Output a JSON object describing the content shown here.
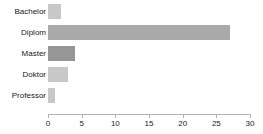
{
  "chart_data": {
    "type": "bar",
    "orientation": "horizontal",
    "title": "",
    "subtitle": "",
    "xlabel": "",
    "ylabel": "",
    "categories": [
      "Bachelor",
      "Diplom",
      "Master",
      "Doktor",
      "Professor"
    ],
    "values": [
      2,
      27,
      4,
      3,
      1
    ],
    "xlim": [
      0,
      30
    ],
    "xticks": [
      0,
      5,
      10,
      15,
      20,
      25,
      30
    ],
    "xtick_labels": [
      "0",
      "5",
      "10",
      "15",
      "20",
      "25",
      "30"
    ],
    "grid": false,
    "legend": null,
    "bar_colors": [
      "#c8c8c8",
      "#a9a9a9",
      "#969696",
      "#c8c8c8",
      "#c8c8c8"
    ],
    "axis_color": "#b3b3b3",
    "text_color": "#1a1a1a",
    "background": "#ffffff",
    "bars": [
      {
        "category": "Bachelor",
        "value": 2,
        "color": "#c8c8c8"
      },
      {
        "category": "Diplom",
        "value": 27,
        "color": "#a9a9a9"
      },
      {
        "category": "Master",
        "value": 4,
        "color": "#969696"
      },
      {
        "category": "Doktor",
        "value": 3,
        "color": "#c8c8c8"
      },
      {
        "category": "Professor",
        "value": 1,
        "color": "#c8c8c8"
      }
    ]
  }
}
